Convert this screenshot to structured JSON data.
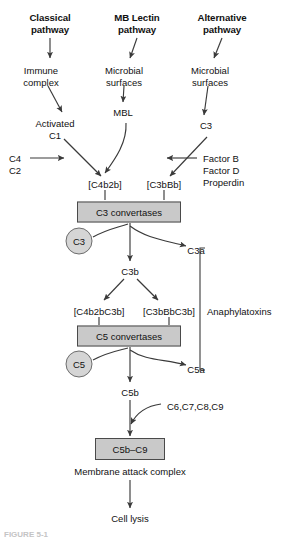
{
  "figure": {
    "caption_partial": "FIGURE 5-1",
    "colors": {
      "box_fill": "#c9c9c9",
      "box_border": "#4a4a4a",
      "circle_fill": "#d5d5d5",
      "circle_border": "#6d6d6d",
      "line": "#3a3a3a",
      "text": "#111111",
      "background": "#ffffff"
    }
  },
  "headers": [
    {
      "id": "classical",
      "line1": "Classical",
      "line2": "pathway",
      "x": 50,
      "y": 12
    },
    {
      "id": "mb-lectin",
      "line1": "MB Lectin",
      "line2": "pathway",
      "x": 137,
      "y": 12
    },
    {
      "id": "alternative",
      "line1": "Alternative",
      "line2": "pathway",
      "x": 222,
      "y": 12
    }
  ],
  "nodes": {
    "immune_complex": {
      "line1": "Immune",
      "line2": "complex",
      "x": 41,
      "y": 72
    },
    "microbial_surfaces_lectin": {
      "line1": "Microbial",
      "line2": "surfaces",
      "x": 124,
      "y": 72
    },
    "microbial_surfaces_alt": {
      "line1": "Microbial",
      "line2": "surfaces",
      "x": 210,
      "y": 72
    },
    "activated_c1": {
      "line1": "Activated",
      "line2": "C1",
      "x": 55,
      "y": 124
    },
    "mbl": {
      "text": "MBL",
      "x": 123,
      "y": 112
    },
    "c3_alt": {
      "text": "C3",
      "x": 206,
      "y": 125
    },
    "c4": {
      "text": "C4",
      "x": 17,
      "y": 158
    },
    "c2": {
      "text": "C2",
      "x": 17,
      "y": 170
    },
    "factor_b": {
      "text": "Factor B",
      "x": 203,
      "y": 158
    },
    "factor_d": {
      "text": "Factor D",
      "x": 203,
      "y": 170
    },
    "properdin": {
      "text": "Properdin",
      "x": 203,
      "y": 182
    },
    "c4b2b": {
      "text": "[C4b2b]",
      "x": 105,
      "y": 184
    },
    "c3bbb": {
      "text": "[C3bBb]",
      "x": 164,
      "y": 184
    },
    "c3_convertases": {
      "text": "C3 convertases",
      "x": 129,
      "y": 212,
      "w": 104,
      "h": 21
    },
    "c3_circle": {
      "text": "C3",
      "x": 79,
      "y": 241,
      "d": 27
    },
    "c3a": {
      "text": "C3a",
      "x": 196,
      "y": 250
    },
    "c3b": {
      "text": "C3b",
      "x": 130,
      "y": 271
    },
    "c4b2bc3b": {
      "text": "[C4b2bC3b]",
      "x": 99,
      "y": 311
    },
    "c3bbbc3b": {
      "text": "[C3bBbC3b]",
      "x": 169,
      "y": 311
    },
    "c5_convertases": {
      "text": "C5 convertases",
      "x": 129,
      "y": 336,
      "w": 104,
      "h": 21
    },
    "c5_circle": {
      "text": "C5",
      "x": 79,
      "y": 364,
      "d": 27
    },
    "c5a": {
      "text": "C5a",
      "x": 196,
      "y": 369
    },
    "c5b": {
      "text": "C5b",
      "x": 130,
      "y": 392
    },
    "c6789": {
      "text": "C6,C7,C8,C9",
      "x": 205,
      "y": 406
    },
    "c5b_c9": {
      "text": "C5b–C9",
      "x": 130,
      "y": 449,
      "w": 70,
      "h": 22
    },
    "membrane_attack_complex": {
      "text": "Membrane attack complex",
      "x": 130,
      "y": 471
    },
    "cell_lysis": {
      "text": "Cell lysis",
      "x": 130,
      "y": 518
    },
    "anaphylatoxins": {
      "text": "Anaphylatoxins",
      "x": 207,
      "y": 311
    }
  }
}
